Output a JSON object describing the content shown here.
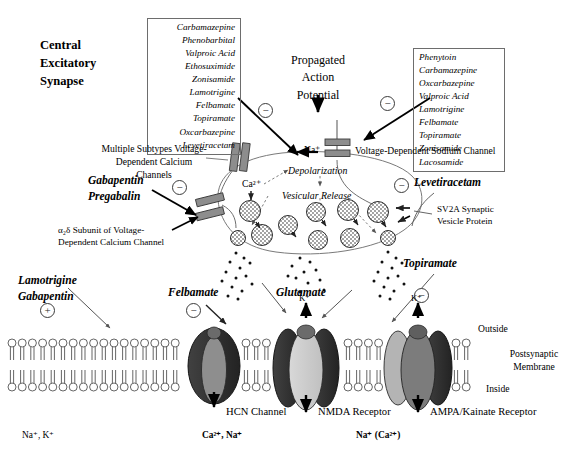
{
  "title": "Central Excitatory Synapse",
  "headings": {
    "synapse_title": "Central\nExcitatory\nSynapse",
    "propagated": "Propagated\nAction\nPotential"
  },
  "drug_lists": {
    "calcium_channel": {
      "name": "calcium-channel-drug-list",
      "drugs": [
        "Carbamazepine",
        "Phenobarbital",
        "Valproic Acid",
        "Ethosuximide",
        "Zonisamide",
        "Lamotrigine",
        "Felbamate",
        "Topiramate",
        "Oxcarbazepine",
        "Levetiracetam"
      ]
    },
    "sodium_channel": {
      "name": "sodium-channel-drug-list",
      "drugs": [
        "Phenytoin",
        "Carbamazepine",
        "Oxcarbazepine",
        "Valproic Acid",
        "Lamotrigine",
        "Felbamate",
        "Topiramate",
        "Zonisamide",
        "Lacosamide"
      ]
    }
  },
  "presynaptic": {
    "calcium_channels_label": "Multiple Subtypes Voltage-\nDependent Calcium Channels",
    "alpha2delta_label": "α₂δ Subunit of Voltage-\nDependent Calcium Channel",
    "sodium_channel_label": "Voltage-Dependent Sodium Channel",
    "sv2a_label": "SV2A Synaptic\nVesicle Protein",
    "gabapentin_pregabalin": "Gabapentin\nPregabalin",
    "levetiracetam": "Levetiracetam",
    "na_ion": "Na⁺",
    "ca_ion": "Ca²⁺",
    "depolarization": "Depolarization",
    "vesicular_release": "Vesicular Release"
  },
  "postsynaptic": {
    "lamotrigine_gabapentin": "Lamotrigine\nGabapentin",
    "felbamate": "Felbamate",
    "glutamate": "Glutamate",
    "topiramate": "Topiramate",
    "outside": "Outside",
    "inside": "Inside",
    "membrane_label": "Postsynaptic\nMembrane",
    "k_ion_nmda": "K⁺",
    "k_ion_ampa": "K⁺",
    "channels": [
      {
        "name": "hcn-channel",
        "label": "HCN Channel",
        "ions": "Na⁺, K⁺",
        "ions_bold": false,
        "modulator_sign": "+"
      },
      {
        "name": "nmda-receptor",
        "label": "NMDA Receptor",
        "ions": "Ca²⁺, Na⁺",
        "ions_bold": true,
        "modulator_sign": "−"
      },
      {
        "name": "ampa-kainate-receptor",
        "label": "AMPA/Kainate Receptor",
        "ions": "Na⁺ (Ca²⁺)",
        "ions_bold": true,
        "modulator_sign": "−"
      }
    ]
  },
  "signs": {
    "calcium_list_sign": "−",
    "sodium_list_sign": "−",
    "gabapentin_sign": "−",
    "levetiracetam_sign": "−",
    "hcn_sign": "+",
    "felbamate_sign": "−",
    "topiramate_sign": "−"
  },
  "colors": {
    "ink": "#000000",
    "line": "#4a4a4a",
    "channel_dark": "#2f2f2f",
    "channel_mid": "#7d7d7d",
    "channel_light": "#b9b9b9",
    "channel_pale": "#d3d3d3",
    "membrane_stroke": "#555555",
    "terminal_stroke": "#7a7a7a"
  }
}
